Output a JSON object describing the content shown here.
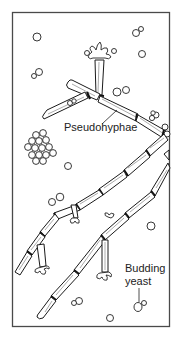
{
  "figure": {
    "labels": {
      "pseudohyphae": "Pseudohyphae",
      "budding_line1": "Budding",
      "budding_line2": "yeast"
    },
    "colors": {
      "line": "#1a1a1a",
      "frame": "#4a4a4a",
      "background": "#ffffff"
    }
  }
}
